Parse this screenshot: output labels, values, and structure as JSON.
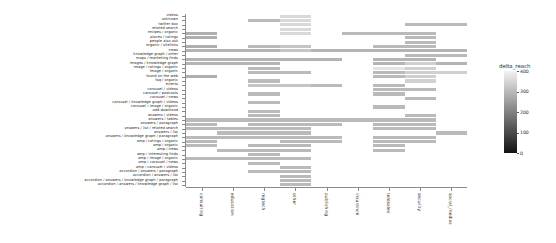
{
  "chart_data": {
    "type": "heatmap",
    "title": "",
    "xlabel": "",
    "ylabel": "",
    "grid": false,
    "legend_position": "right",
    "colormap": "grayscale-inverted",
    "colorbar": {
      "title": "delta_reach",
      "ticks": [
        400,
        300,
        200,
        100,
        0
      ],
      "vmin": 0,
      "vmax": 400,
      "low_color": "#151515",
      "high_color": "#f2f2f2"
    },
    "categories_x": [
      "consulting",
      "education",
      "regtech",
      "other",
      "publishing",
      "insurance",
      "telesales",
      "security",
      "social_medias"
    ],
    "categories_y": [
      "videos",
      "unknown",
      "twitter box",
      "related search",
      "recipes / organic",
      "places / ratings",
      "people also ask",
      "organic / sitelinks",
      "news",
      "knowledge graph / other",
      "maps / marketing finds",
      "images / knowledge graph",
      "image / ratings / organic",
      "image / organic",
      "found on the web",
      "faq / organic",
      "events",
      "carousel / videos",
      "carousel / podcasts",
      "carousel / news",
      "carousel / knowledge graph / videos",
      "carousel / image / organic",
      "add download",
      "answers / videos",
      "answers / tables",
      "answers / paragraph",
      "answers / list / related search",
      "answers / list",
      "answers / knowledge graph / paragraph",
      "amp / ratings / organic",
      "amp / organic",
      "amp / news",
      "amp / interesting finds",
      "amp / image / organic",
      "amp / carousel / news",
      "amp / carousel / videos",
      "accordion / answers / paragraph",
      "accordion / answers / list",
      "accordion / answers / knowledge graph / paragraph",
      "accordion / answers / knowledge graph / list"
    ],
    "values": [
      [
        null,
        null,
        null,
        355,
        null,
        null,
        null,
        null,
        null
      ],
      [
        null,
        null,
        300,
        355,
        null,
        null,
        null,
        null,
        null
      ],
      [
        null,
        null,
        null,
        355,
        null,
        null,
        null,
        300,
        300
      ],
      [
        null,
        null,
        null,
        355,
        null,
        null,
        null,
        null,
        null
      ],
      [
        280,
        null,
        null,
        355,
        null,
        300,
        300,
        300,
        null
      ],
      [
        280,
        null,
        null,
        null,
        null,
        null,
        null,
        300,
        null
      ],
      [
        null,
        null,
        null,
        null,
        null,
        null,
        null,
        300,
        null
      ],
      [
        280,
        null,
        300,
        320,
        null,
        null,
        300,
        300,
        null
      ],
      [
        290,
        290,
        290,
        320,
        290,
        290,
        290,
        290,
        290
      ],
      [
        null,
        null,
        null,
        null,
        null,
        null,
        null,
        300,
        300
      ],
      [
        290,
        290,
        290,
        290,
        290,
        null,
        290,
        290,
        null
      ],
      [
        290,
        290,
        290,
        null,
        null,
        null,
        290,
        340,
        290
      ],
      [
        null,
        null,
        300,
        null,
        null,
        null,
        375,
        340,
        null
      ],
      [
        null,
        null,
        300,
        300,
        null,
        null,
        300,
        340,
        340
      ],
      [
        280,
        null,
        null,
        null,
        null,
        null,
        300,
        340,
        null
      ],
      [
        null,
        null,
        300,
        null,
        null,
        null,
        null,
        340,
        null
      ],
      [
        null,
        null,
        320,
        320,
        300,
        null,
        300,
        null,
        null
      ],
      [
        null,
        null,
        null,
        null,
        null,
        null,
        300,
        300,
        null
      ],
      [
        null,
        null,
        300,
        null,
        null,
        null,
        300,
        null,
        null
      ],
      [
        null,
        null,
        null,
        null,
        null,
        null,
        null,
        300,
        null
      ],
      [
        null,
        null,
        300,
        null,
        null,
        null,
        null,
        null,
        null
      ],
      [
        null,
        null,
        null,
        null,
        null,
        null,
        300,
        null,
        null
      ],
      [
        null,
        null,
        300,
        null,
        null,
        null,
        null,
        null,
        null
      ],
      [
        null,
        null,
        300,
        null,
        null,
        null,
        null,
        300,
        null
      ],
      [
        300,
        300,
        300,
        300,
        300,
        300,
        300,
        300,
        null
      ],
      [
        300,
        null,
        300,
        300,
        300,
        null,
        300,
        300,
        null
      ],
      [
        300,
        300,
        300,
        300,
        null,
        null,
        300,
        300,
        null
      ],
      [
        null,
        300,
        300,
        300,
        null,
        null,
        null,
        null,
        300
      ],
      [
        300,
        300,
        300,
        300,
        300,
        null,
        300,
        300,
        null
      ],
      [
        300,
        null,
        null,
        300,
        300,
        null,
        300,
        300,
        null
      ],
      [
        300,
        null,
        300,
        300,
        null,
        null,
        300,
        null,
        null
      ],
      [
        null,
        300,
        300,
        300,
        null,
        null,
        300,
        null,
        null
      ],
      [
        null,
        null,
        300,
        null,
        null,
        null,
        null,
        null,
        null
      ],
      [
        300,
        300,
        300,
        300,
        null,
        null,
        null,
        null,
        null
      ],
      [
        null,
        null,
        300,
        null,
        null,
        null,
        null,
        null,
        null
      ],
      [
        null,
        null,
        null,
        300,
        null,
        null,
        null,
        null,
        null
      ],
      [
        null,
        null,
        300,
        300,
        null,
        null,
        null,
        null,
        null
      ],
      [
        null,
        null,
        null,
        300,
        null,
        null,
        null,
        null,
        null
      ],
      [
        null,
        null,
        null,
        300,
        null,
        null,
        null,
        null,
        null
      ],
      [
        null,
        null,
        null,
        300,
        null,
        null,
        null,
        null,
        null
      ]
    ]
  }
}
